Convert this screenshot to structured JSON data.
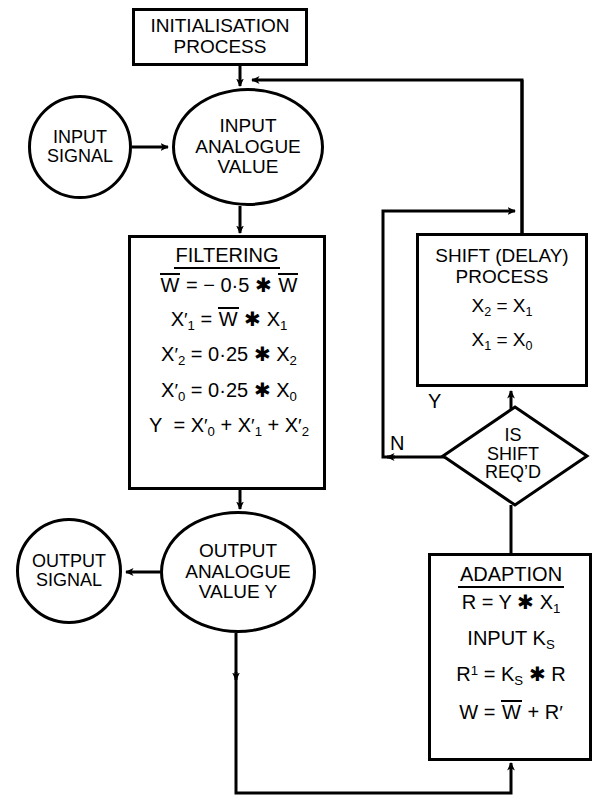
{
  "diagram": {
    "stroke_color": "#000000",
    "background_color": "#ffffff"
  },
  "nodes": {
    "initialisation": {
      "shape": "process",
      "line1": "INITIALISATION",
      "line2": "PROCESS"
    },
    "input_signal": {
      "shape": "terminator",
      "line1": "INPUT",
      "line2": "SIGNAL"
    },
    "input_analogue": {
      "shape": "terminator",
      "line1": "INPUT",
      "line2": "ANALOGUE",
      "line3": "VALUE"
    },
    "filtering": {
      "shape": "process",
      "title": "FILTERING",
      "equations": [
        {
          "id": "eq-w",
          "text": "W̅ = − 0·5 * W̅"
        },
        {
          "id": "eq-x1",
          "text": "X′1 = W̅ * X1"
        },
        {
          "id": "eq-x2",
          "text": "X′2 = 0·25 * X2"
        },
        {
          "id": "eq-x0",
          "text": "X′0 = 0·25 * X0"
        },
        {
          "id": "eq-y",
          "text": "Y = X′0 + X′1 + X′2"
        }
      ]
    },
    "shift": {
      "shape": "process",
      "line1": "SHIFT (DELAY)",
      "line2": "PROCESS",
      "equations": [
        {
          "id": "shift-eq1",
          "text": "X2 = X1"
        },
        {
          "id": "shift-eq2",
          "text": "X1 = X0"
        }
      ]
    },
    "decision": {
      "shape": "decision",
      "line1": "IS",
      "line2": "SHIFT",
      "line3": "REQ’D",
      "yes_label": "Y",
      "no_label": "N"
    },
    "adaption": {
      "shape": "process",
      "title": "ADAPTION",
      "equations": [
        {
          "id": "ad-eq1",
          "text": "R = Y * X1"
        },
        {
          "id": "ad-eq2",
          "text": "INPUT KS"
        },
        {
          "id": "ad-eq3",
          "text": "R¹ = KS * R"
        },
        {
          "id": "ad-eq4",
          "text": "W = W̅ + R′"
        }
      ]
    },
    "output_analogue": {
      "shape": "terminator",
      "line1": "OUTPUT",
      "line2": "ANALOGUE",
      "line3": "VALUE Y"
    },
    "output_signal": {
      "shape": "terminator",
      "line1": "OUTPUT",
      "line2": "SIGNAL"
    }
  },
  "connectors": [
    {
      "id": "c1",
      "from": "initialisation",
      "to": "input_analogue",
      "arrow": "down"
    },
    {
      "id": "c2",
      "from": "input_signal",
      "to": "input_analogue",
      "arrow": "right"
    },
    {
      "id": "c3",
      "from": "input_analogue",
      "to": "filtering",
      "arrow": "down"
    },
    {
      "id": "c4",
      "from": "filtering",
      "to": "output_analogue",
      "arrow": "down"
    },
    {
      "id": "c5",
      "from": "output_analogue",
      "to": "output_signal",
      "arrow": "left"
    },
    {
      "id": "c6",
      "from": "output_analogue",
      "to": "adaption",
      "arrow": "down"
    },
    {
      "id": "c7",
      "from": "adaption",
      "to": "decision",
      "arrow": "up"
    },
    {
      "id": "c8",
      "from": "decision",
      "to": "shift",
      "arrow": "up",
      "label": "Y"
    },
    {
      "id": "c9",
      "from": "decision",
      "to": "shift",
      "arrow": "right",
      "label": "N"
    },
    {
      "id": "c10",
      "from": "shift",
      "to": "input_analogue",
      "arrow": "left"
    }
  ]
}
